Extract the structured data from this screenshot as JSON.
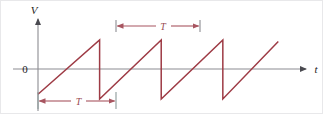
{
  "figure": {
    "kind": "waveform-plot",
    "background_color": "#ffffff",
    "border_color": "#e8e8ea"
  },
  "axes": {
    "vertical_label": "V",
    "horizontal_label": "t",
    "origin_label": "0",
    "axis_color": "#6e6e74",
    "label_color": "#1a1a1a"
  },
  "annotations": {
    "period_top_label": "T",
    "period_bottom_label": "T",
    "annotation_color": "#a85560"
  },
  "chart_data": {
    "type": "line",
    "title": "",
    "xlabel": "t",
    "ylabel": "V",
    "grid": false,
    "legend": null,
    "series": [
      {
        "name": "sawtooth",
        "color": "#9e3b45",
        "x": [
          0.0,
          1.0,
          1.0,
          2.0,
          2.0,
          3.0,
          3.0,
          3.9
        ],
        "y": [
          -0.7,
          1.0,
          -0.85,
          1.0,
          -0.85,
          1.0,
          -0.85,
          0.95
        ]
      }
    ],
    "xlim": [
      0.0,
      4.35
    ],
    "ylim": [
      -1.25,
      1.35
    ],
    "annotations": [
      {
        "type": "dimension",
        "label": "T",
        "position": "above",
        "x_from": 1.0,
        "x_to": 2.0,
        "y": 1.3,
        "arrows": "both"
      },
      {
        "type": "dimension",
        "label": "T",
        "position": "below",
        "x_from": 0.0,
        "x_to": 1.0,
        "y": -1.15,
        "arrows": "both"
      }
    ]
  }
}
